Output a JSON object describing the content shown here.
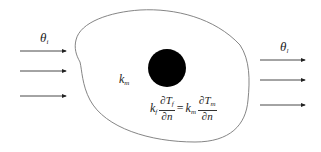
{
  "diagram": {
    "inlet_label": "θ",
    "inlet_sub": "i",
    "outlet_label": "θ",
    "outlet_sub": "l",
    "matrix_label": "k",
    "matrix_sub": "m",
    "interface_condition": {
      "lhs_coef": "k",
      "lhs_coef_sub": "f",
      "lhs_num": "∂T",
      "lhs_num_sub": "f",
      "lhs_den": "∂n",
      "equals": "=",
      "rhs_coef": "k",
      "rhs_coef_sub": "m",
      "rhs_num": "∂T",
      "rhs_num_sub": "m",
      "rhs_den": "∂n"
    },
    "colors": {
      "outline": "#777777",
      "inclusion": "#000000",
      "arrows": "#333333"
    }
  }
}
